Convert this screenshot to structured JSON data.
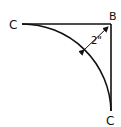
{
  "diagram": {
    "labels": {
      "left_point": "C",
      "corner_point": "B",
      "bottom_point": "C",
      "dimension": "2\""
    },
    "colors": {
      "stroke": "#111111",
      "background": "#ffffff"
    }
  }
}
